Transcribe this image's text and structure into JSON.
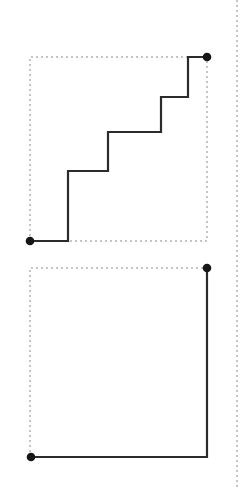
{
  "canvas": {
    "width": 245,
    "height": 490,
    "background": "#ffffff"
  },
  "style": {
    "dashed_color": "#8a8a8a",
    "dashed_width": 1,
    "dashed_pattern": "2 3",
    "solid_color": "#2b2b2b",
    "solid_width": 2.2,
    "dot_color": "#161616",
    "dot_radius": 4.3
  },
  "chart_data": {
    "type": "line",
    "title": "",
    "xlabel": "",
    "ylabel": "",
    "xlim": [
      0,
      245
    ],
    "ylim": [
      0,
      490
    ],
    "grid": false,
    "legend": "none",
    "series": [
      {
        "name": "staircase-path-top",
        "kind": "step",
        "points": [
          [
            30,
            241
          ],
          [
            68,
            241
          ],
          [
            68,
            171
          ],
          [
            108,
            171
          ],
          [
            108,
            132
          ],
          [
            161,
            132
          ],
          [
            161,
            97
          ],
          [
            188,
            97
          ],
          [
            188,
            57
          ],
          [
            207,
            57
          ]
        ]
      },
      {
        "name": "corner-path-bottom",
        "kind": "step",
        "points": [
          [
            31,
            457
          ],
          [
            207,
            457
          ],
          [
            207,
            268
          ]
        ]
      }
    ],
    "bounding_boxes": [
      {
        "name": "dotted-bounding-box-top",
        "x": 30,
        "y": 57,
        "width": 177,
        "height": 184
      },
      {
        "name": "dotted-bounding-box-bottom",
        "x": 30,
        "y": 268,
        "width": 177,
        "height": 189
      }
    ],
    "guide_lines": [
      {
        "name": "right-margin-guide",
        "orientation": "vertical",
        "x": 237,
        "y_start": 0,
        "y_end": 490
      }
    ],
    "endpoints": [
      {
        "name": "start-dot-top",
        "x": 30,
        "y": 241
      },
      {
        "name": "end-dot-top",
        "x": 207,
        "y": 57
      },
      {
        "name": "start-dot-bottom",
        "x": 31,
        "y": 457
      },
      {
        "name": "end-dot-bottom",
        "x": 207,
        "y": 268
      }
    ]
  },
  "paths": {
    "top_staircase_d": "M 30 241 L 68 241 L 68 171 L 108 171 L 108 132 L 161 132 L 161 97 L 188 97 L 188 57 L 207 57",
    "bottom_corner_d": "M 31 457 L 207 457 L 207 268",
    "top_box_d": "M 30 241 L 30 57 L 207 57 L 207 241 L 30 241",
    "bottom_box_d": "M 30 457 L 30 268 L 207 268 L 207 457 L 30 457",
    "right_guide_d": "M 237 0 L 237 490"
  }
}
